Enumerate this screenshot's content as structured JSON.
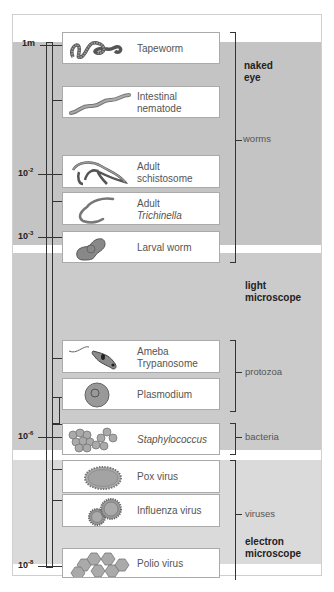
{
  "diagram": {
    "scale": [
      {
        "label": "1m",
        "exp": "",
        "y": 45
      },
      {
        "label": "10",
        "exp": "-2",
        "y": 174
      },
      {
        "label": "10",
        "exp": "-3",
        "y": 237
      },
      {
        "label": "10",
        "exp": "-6",
        "y": 437
      },
      {
        "label": "10",
        "exp": "-8",
        "y": 566
      }
    ],
    "organisms": [
      {
        "name": "Tapeworm",
        "icon": "tapeworm-icon"
      },
      {
        "name": "Intestinal nematode",
        "line1": "Intestinal",
        "line2": "nematode",
        "icon": "nematode-icon"
      },
      {
        "name": "Adult schistosome",
        "line1": "Adult",
        "line2": "schistosome",
        "icon": "schistosome-icon"
      },
      {
        "name": "Adult Trichinella",
        "line1": "Adult",
        "line2": "Trichinella",
        "icon": "trichinella-icon"
      },
      {
        "name": "Larval worm",
        "icon": "larval-worm-icon"
      },
      {
        "name": "Ameba Trypanosome",
        "line1": "Ameba",
        "line2": "Trypanosome",
        "icon": "trypanosome-icon"
      },
      {
        "name": "Plasmodium",
        "icon": "plasmodium-icon"
      },
      {
        "name": "Staphylococcus",
        "icon": "staphylococcus-icon"
      },
      {
        "name": "Pox virus",
        "icon": "pox-virus-icon"
      },
      {
        "name": "Influenza virus",
        "icon": "influenza-virus-icon"
      },
      {
        "name": "Polio virus",
        "icon": "polio-virus-icon"
      }
    ],
    "groups": {
      "worms": "worms",
      "protozoa": "protozoa",
      "bacteria": "bacteria",
      "viruses": "viruses"
    },
    "ranges": {
      "naked_eye_1": "naked",
      "naked_eye_2": "eye",
      "light_1": "light",
      "light_2": "microscope",
      "electron_1": "electron",
      "electron_2": "microscope"
    },
    "colors": {
      "naked_eye_band": "#c4c4c4",
      "light_microscope_band": "#cbcbcb",
      "electron_microscope_band": "#dadada",
      "organism_fill": "#9a9a9a"
    }
  }
}
